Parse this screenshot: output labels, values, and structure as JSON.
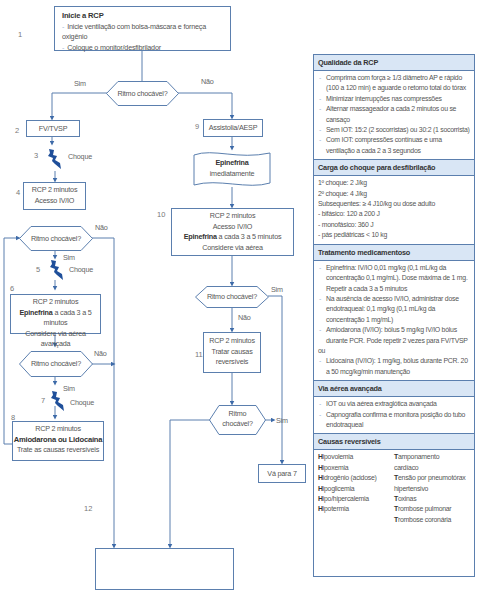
{
  "flowchart": {
    "step1": {
      "number": "1",
      "title": "Inicie a RCP",
      "bullets": [
        "Inicie ventilação com bolsa-máscara e forneça oxigênio",
        "Coloque o monitor/desfibrilador"
      ]
    },
    "decision_main": {
      "label": "Ritmo chocável?",
      "yes": "Sim",
      "no": "Não"
    },
    "step2": {
      "number": "2",
      "label": "FV/TVSP"
    },
    "step3": {
      "number": "3",
      "label": "Choque",
      "icon": "lightning-bolt-icon"
    },
    "step4": {
      "number": "4",
      "lines": [
        "RCP 2 minutos",
        "Acesso IV/IO"
      ]
    },
    "decision_a": {
      "label": "Ritmo chocável?",
      "yes": "Sim",
      "no": "Não"
    },
    "step5": {
      "number": "5",
      "label": "Choque",
      "icon": "lightning-bolt-icon"
    },
    "step6": {
      "number": "6",
      "line1": "RCP 2 minutos",
      "line2_bold": "Epinefrina",
      "line2_rest": " a cada 3 a 5 minutos",
      "line3": "Considere via aérea avançada"
    },
    "decision_b": {
      "label": "Ritmo chocável?",
      "yes": "Sim",
      "no": "Não"
    },
    "step7": {
      "number": "7",
      "label": "Choque",
      "icon": "lightning-bolt-icon"
    },
    "step8": {
      "number": "8",
      "line1": "RCP 2 minutos",
      "line2_bold": "Amiodarona ou Lidocaína",
      "line3": "Trate as causas reversíveis"
    },
    "step9": {
      "number": "9",
      "label": "Assistolia/AESP"
    },
    "epinephrine_doc": {
      "bold": "Epinefrina",
      "line2": "imediatamente"
    },
    "step10": {
      "number": "10",
      "line1": "RCP 2 minutos",
      "line2": "Acesso IV/IO",
      "line3_bold": "Epinefrina",
      "line3_rest": " a cada 3 a 5 minutos",
      "line4": "Considere via aérea"
    },
    "decision_c": {
      "label": "Ritmo chocável?",
      "yes": "Sim",
      "no": "Não"
    },
    "step11": {
      "number": "11",
      "lines": [
        "RCP 2 minutos",
        "Tratar causas",
        "reversíveis"
      ]
    },
    "decision_d": {
      "line1": "Ritmo",
      "line2": "chocável?",
      "yes": "Sim"
    },
    "goto7": {
      "label": "Vá para 7"
    },
    "step12": {
      "number": "12",
      "bullets": [
        "Se não houver sinal de retorno da circulação espontânea (RCE), vá para 10",
        "Se houver RCE, vá para os cuidados pós-PCR"
      ]
    }
  },
  "panel": {
    "quality": {
      "title": "Qualidade da RCP",
      "items": [
        "Comprima com força ≥ 1/3 diâmetro AP e rápido (100 a 120 min) e aguarde o retorno total do tórax",
        "Minimizar interrupções nas compressões",
        "Alternar massageador a cada 2 minutos ou se cansaço",
        "Sem IOT: 15:2 (2 socorristas) ou 30:2 (1 socorrista)",
        "Com IOT: compressões contínuas e uma ventilação a cada 2 a 3 segundos"
      ]
    },
    "shock": {
      "title": "Carga do choque para desfibrilação",
      "lines": [
        "1º choque: 2 J/kg",
        "2º choque: 4 J/kg",
        "Subsequentes: ≥ 4 J10/kg ou dose adulto",
        "- bifásico: 120 a 200 J",
        "- monofásico: 360 J",
        "- pás pediátricas < 10 kg"
      ]
    },
    "drugs": {
      "title": "Tratamento medicamentoso",
      "items": [
        "Epinefrina: IV/IO 0,01 mg/kg (0,1 mL/kg da concentração 0,1 mg/mL). Dose máxima de 1 mg. Repetir a cada 3 a 5 minutos",
        "Na ausência de acesso IV/IO, administrar dose endotraqueal: 0,1 mg/kg (0,1 mL/kg da concentração 1 mg/mL)",
        "Amiodarona (IV/IO): bólus 5 mg/kg IV/IO bólus durante PCR. Pode repetir 2 vezes para FV/TVSP"
      ],
      "or": "ou",
      "last": "Lidocaína (IV/IO): 1 mg/kg, bólus durante PCR. 20 a 50 mcg/kg/min manutenção"
    },
    "airway": {
      "title": "Via aérea avançada",
      "items": [
        "IOT ou via aérea extraglótica avançada",
        "Capnografia confirma e monitora posição do tubo endotraqueal"
      ]
    },
    "causes": {
      "title": "Causas reversíveis",
      "left": [
        {
          "initial": "H",
          "rest": "ipovolemia"
        },
        {
          "initial": "H",
          "rest": "ipoxemia"
        },
        {
          "initial": "H",
          "rest": "idrogênio (acidose)"
        },
        {
          "initial": "H",
          "rest": "ipoglicemia"
        },
        {
          "initial": "H",
          "rest": "ipo/hipercalemia"
        },
        {
          "initial": "H",
          "rest": "ipotermia"
        }
      ],
      "right": [
        {
          "initial": "T",
          "rest": "amponamento"
        },
        {
          "initial": "",
          "rest": "cardíaco"
        },
        {
          "initial": "T",
          "rest": "ensão por pneumotórax"
        },
        {
          "initial": "",
          "rest": " hipertensivo"
        },
        {
          "initial": "T",
          "rest": "oxinas"
        },
        {
          "initial": "T",
          "rest": "rombose pulmonar"
        },
        {
          "initial": "T",
          "rest": "rombose coronária"
        }
      ]
    }
  },
  "colors": {
    "line": "#5b7fae",
    "arrow": "#3d6aa8",
    "header_bg": "#d9e6f5",
    "bolt": "#1f4f9a",
    "text": "#555555"
  }
}
